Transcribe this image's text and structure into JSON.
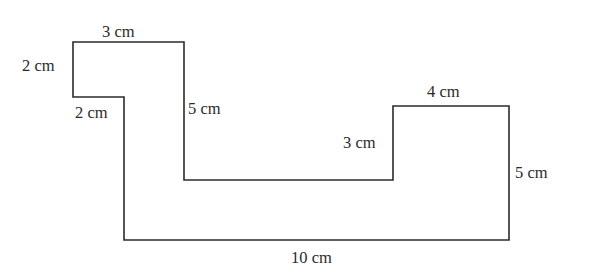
{
  "diagram": {
    "type": "rectilinear-polygon",
    "stroke_color": "#2b2b2b",
    "background_color": "#ffffff",
    "vertices": [
      [
        73,
        42
      ],
      [
        184,
        42
      ],
      [
        184,
        180
      ],
      [
        393,
        180
      ],
      [
        393,
        106
      ],
      [
        509,
        106
      ],
      [
        509,
        240
      ],
      [
        124,
        240
      ],
      [
        124,
        97
      ],
      [
        73,
        97
      ]
    ],
    "labels": [
      {
        "id": "top-left-width",
        "text": "3 cm",
        "x": 102,
        "y": 37
      },
      {
        "id": "left-height",
        "text": "2 cm",
        "x": 22,
        "y": 71
      },
      {
        "id": "inner-step-width",
        "text": "2 cm",
        "x": 75,
        "y": 118
      },
      {
        "id": "middle-drop",
        "text": "5 cm",
        "x": 188,
        "y": 114
      },
      {
        "id": "right-step-height",
        "text": "3 cm",
        "x": 343,
        "y": 148
      },
      {
        "id": "right-top-width",
        "text": "4 cm",
        "x": 427,
        "y": 97
      },
      {
        "id": "right-height",
        "text": "5 cm",
        "x": 515,
        "y": 178
      },
      {
        "id": "bottom-width",
        "text": "10 cm",
        "x": 291,
        "y": 263
      }
    ]
  }
}
